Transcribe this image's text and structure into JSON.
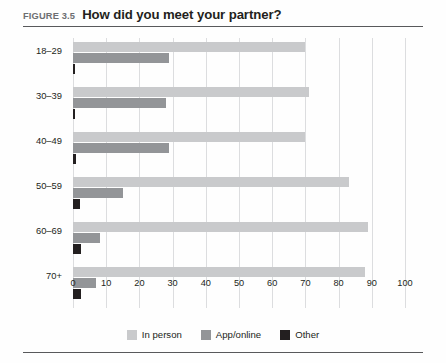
{
  "figure": {
    "number_label": "FIGURE 3.5",
    "title": "How did you meet your partner?"
  },
  "legend": {
    "position": "bottom-center",
    "items": [
      {
        "label": "In person",
        "color": "#c9cacc"
      },
      {
        "label": "App/online",
        "color": "#939598"
      },
      {
        "label": "Other",
        "color": "#231f20"
      }
    ]
  },
  "axis": {
    "x_ticks": [
      "0",
      "10",
      "20",
      "30",
      "40",
      "50",
      "60",
      "70",
      "80",
      "90",
      "100"
    ],
    "y_categories": [
      "18–29",
      "30–39",
      "40–49",
      "50–59",
      "60–69",
      "70+"
    ]
  },
  "chart_data": {
    "type": "bar",
    "orientation": "horizontal",
    "title": "How did you meet your partner?",
    "xlabel": "",
    "ylabel": "",
    "xlim": [
      0,
      100
    ],
    "xticks": [
      0,
      10,
      20,
      30,
      40,
      50,
      60,
      70,
      80,
      90,
      100
    ],
    "grid": true,
    "legend_position": "bottom-center",
    "categories": [
      "18–29",
      "30–39",
      "40–49",
      "50–59",
      "60–69",
      "70+"
    ],
    "series": [
      {
        "name": "In person",
        "color": "#c9cacc",
        "values": [
          70,
          71,
          70,
          83,
          89,
          88
        ]
      },
      {
        "name": "App/online",
        "color": "#939598",
        "values": [
          29,
          28,
          29,
          15,
          8,
          7
        ]
      },
      {
        "name": "Other",
        "color": "#231f20",
        "values": [
          0.6,
          0.6,
          0.8,
          2,
          2.5,
          2.5
        ]
      }
    ]
  }
}
